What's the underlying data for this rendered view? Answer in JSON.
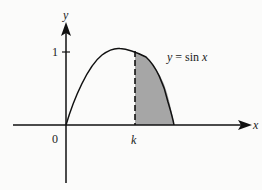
{
  "diagram": {
    "y_axis_label": "y",
    "x_axis_label": "x",
    "origin_label": "0",
    "y_tick_label": "1",
    "k_label": "k",
    "curve_label_y": "y",
    "curve_label_eq": "= sin",
    "curve_label_x": "x",
    "shade_color": "#a6a6a6",
    "line_color": "#111111"
  }
}
